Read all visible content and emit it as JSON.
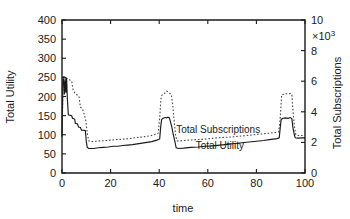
{
  "chart_data": {
    "type": "line",
    "title": "",
    "xlabel": "time",
    "ylabel": "Total Utility",
    "y2label": "Total Subscriptions",
    "y2_multiplier": "×10",
    "y2_multiplier_exp": "3",
    "xlim": [
      0,
      100
    ],
    "ylim": [
      0,
      400
    ],
    "y2lim": [
      0,
      10
    ],
    "xticks": [
      "0",
      "20",
      "40",
      "60",
      "80",
      "100"
    ],
    "xtick_values": [
      0,
      20,
      40,
      60,
      80,
      100
    ],
    "yticks": [
      "0",
      "50",
      "100",
      "150",
      "200",
      "250",
      "300",
      "350",
      "400"
    ],
    "ytick_values": [
      0,
      50,
      100,
      150,
      200,
      250,
      300,
      350,
      400
    ],
    "y2ticks": [
      "0",
      "2",
      "4",
      "6",
      "8",
      "10"
    ],
    "y2tick_values": [
      0,
      2,
      4,
      6,
      8,
      10
    ],
    "grid": false,
    "legend_position": "inline-annotation",
    "series": [
      {
        "name": "Total Utility",
        "axis": "left",
        "style": "solid",
        "color": "#1a1a1a",
        "label_x": 55,
        "label_y": 62,
        "points": [
          [
            0.0,
            95
          ],
          [
            0.4,
            250
          ],
          [
            0.8,
            237
          ],
          [
            1.0,
            205
          ],
          [
            1.3,
            248
          ],
          [
            1.6,
            210
          ],
          [
            1.9,
            248
          ],
          [
            2.2,
            195
          ],
          [
            2.6,
            152
          ],
          [
            4.0,
            150
          ],
          [
            4.3,
            143
          ],
          [
            5.2,
            141
          ],
          [
            5.5,
            130
          ],
          [
            6.4,
            128
          ],
          [
            6.8,
            120
          ],
          [
            7.6,
            119
          ],
          [
            8.0,
            112
          ],
          [
            9.6,
            111
          ],
          [
            10.0,
            82
          ],
          [
            10.4,
            67
          ],
          [
            11.0,
            64
          ],
          [
            13.0,
            64
          ],
          [
            15.0,
            66
          ],
          [
            17.0,
            67
          ],
          [
            19.0,
            68
          ],
          [
            21.0,
            70
          ],
          [
            23.0,
            70
          ],
          [
            25.0,
            72
          ],
          [
            27.0,
            73
          ],
          [
            29.0,
            74
          ],
          [
            31.0,
            76
          ],
          [
            33.0,
            78
          ],
          [
            35.0,
            80
          ],
          [
            37.0,
            82
          ],
          [
            39.0,
            86
          ],
          [
            40.2,
            89
          ],
          [
            40.6,
            120
          ],
          [
            41.0,
            140
          ],
          [
            41.6,
            143
          ],
          [
            42.4,
            145
          ],
          [
            43.0,
            144
          ],
          [
            43.6,
            146
          ],
          [
            44.2,
            144
          ],
          [
            44.8,
            130
          ],
          [
            45.2,
            120
          ],
          [
            45.8,
            100
          ],
          [
            46.4,
            84
          ],
          [
            47.0,
            66
          ],
          [
            48.0,
            64
          ],
          [
            50.0,
            65
          ],
          [
            53.0,
            67
          ],
          [
            56.0,
            68
          ],
          [
            59.0,
            70
          ],
          [
            62.0,
            71
          ],
          [
            65.0,
            73
          ],
          [
            68.0,
            75
          ],
          [
            71.0,
            77
          ],
          [
            74.0,
            79
          ],
          [
            77.0,
            81
          ],
          [
            80.0,
            83
          ],
          [
            83.0,
            85
          ],
          [
            86.0,
            88
          ],
          [
            88.5,
            90
          ],
          [
            89.4,
            92
          ],
          [
            89.8,
            118
          ],
          [
            90.2,
            140
          ],
          [
            91.0,
            143
          ],
          [
            92.0,
            144
          ],
          [
            93.0,
            143
          ],
          [
            94.0,
            145
          ],
          [
            94.6,
            142
          ],
          [
            95.0,
            120
          ],
          [
            95.6,
            100
          ],
          [
            96.0,
            92
          ],
          [
            97.0,
            91
          ],
          [
            99.0,
            92
          ],
          [
            100.0,
            92
          ]
        ]
      },
      {
        "name": "Total Subscriptions",
        "axis": "right",
        "style": "dotted",
        "color": "#4a4a4a",
        "label_x": 47,
        "label_y": 104,
        "points": [
          [
            0.0,
            2.4
          ],
          [
            0.5,
            6.3
          ],
          [
            1.2,
            6.3
          ],
          [
            2.0,
            6.2
          ],
          [
            3.0,
            6.1
          ],
          [
            4.0,
            6.0
          ],
          [
            4.6,
            5.4
          ],
          [
            5.4,
            5.2
          ],
          [
            6.2,
            5.1
          ],
          [
            7.0,
            5.0
          ],
          [
            7.6,
            4.3
          ],
          [
            8.4,
            4.2
          ],
          [
            9.2,
            3.8
          ],
          [
            9.8,
            3.4
          ],
          [
            10.4,
            2.6
          ],
          [
            11.0,
            2.1
          ],
          [
            12.0,
            2.05
          ],
          [
            14.0,
            2.08
          ],
          [
            16.0,
            2.1
          ],
          [
            18.0,
            2.12
          ],
          [
            20.0,
            2.15
          ],
          [
            22.0,
            2.18
          ],
          [
            24.0,
            2.2
          ],
          [
            26.0,
            2.22
          ],
          [
            28.0,
            2.25
          ],
          [
            30.0,
            2.3
          ],
          [
            32.0,
            2.34
          ],
          [
            34.0,
            2.38
          ],
          [
            36.0,
            2.42
          ],
          [
            38.0,
            2.5
          ],
          [
            39.6,
            2.6
          ],
          [
            40.2,
            3.6
          ],
          [
            40.8,
            5.0
          ],
          [
            41.4,
            5.15
          ],
          [
            42.2,
            5.2
          ],
          [
            43.0,
            5.35
          ],
          [
            43.8,
            5.3
          ],
          [
            44.4,
            5.2
          ],
          [
            45.0,
            5.1
          ],
          [
            45.6,
            4.4
          ],
          [
            46.2,
            3.3
          ],
          [
            46.8,
            2.4
          ],
          [
            47.4,
            2.1
          ],
          [
            49.0,
            2.1
          ],
          [
            52.0,
            2.15
          ],
          [
            55.0,
            2.18
          ],
          [
            58.0,
            2.2
          ],
          [
            61.0,
            2.25
          ],
          [
            64.0,
            2.3
          ],
          [
            67.0,
            2.33
          ],
          [
            70.0,
            2.36
          ],
          [
            73.0,
            2.4
          ],
          [
            76.0,
            2.45
          ],
          [
            79.0,
            2.5
          ],
          [
            82.0,
            2.55
          ],
          [
            85.0,
            2.6
          ],
          [
            88.0,
            2.65
          ],
          [
            89.2,
            2.7
          ],
          [
            89.8,
            3.6
          ],
          [
            90.4,
            5.1
          ],
          [
            91.2,
            5.15
          ],
          [
            92.0,
            5.2
          ],
          [
            93.0,
            5.15
          ],
          [
            94.0,
            5.2
          ],
          [
            94.6,
            5.1
          ],
          [
            95.0,
            4.2
          ],
          [
            95.6,
            3.1
          ],
          [
            96.2,
            2.5
          ],
          [
            97.0,
            2.45
          ],
          [
            99.0,
            2.45
          ],
          [
            100.0,
            2.45
          ]
        ]
      }
    ]
  }
}
